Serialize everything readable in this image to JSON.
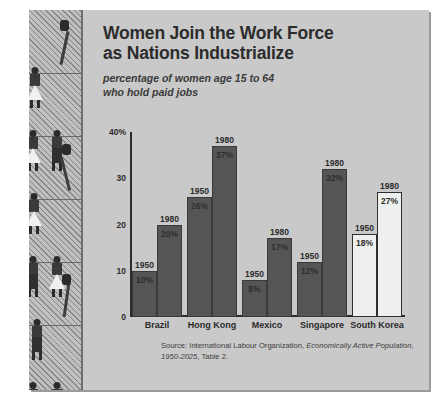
{
  "title": "Women Join the Work Force as Nations Industrialize",
  "title_line1": "Women Join the Work Force",
  "title_line2": "as Nations Industrialize",
  "subtitle_line1": "percentage of women age 15 to 64",
  "subtitle_line2": "who hold paid jobs",
  "source": {
    "prefix": "Source: International Labour Organization, ",
    "italic": "Economically Active Population, 1950-2025",
    "suffix": ", Table 2."
  },
  "colors": {
    "panel_bg": "#c9c9c9",
    "strip_bg": "#bfbfbf",
    "bar_dark": "#555555",
    "bar_light": "#eef0ee",
    "ink": "#2b2b2b"
  },
  "illustration": {
    "name": "women-workers-strip",
    "panels": 6
  },
  "chart_data": {
    "type": "bar",
    "title": "Women Join the Work Force as Nations Industrialize",
    "subtitle": "percentage of women age 15 to 64 who hold paid jobs",
    "xlabel": "",
    "ylabel": "",
    "ylim": [
      0,
      40
    ],
    "grid": false,
    "legend": "none",
    "y_ticks": [
      "0",
      "10",
      "20",
      "30",
      "40%"
    ],
    "categories": [
      "Brazil",
      "Hong Kong",
      "Mexico",
      "Singapore",
      "South Korea"
    ],
    "series": [
      {
        "name": "1950",
        "values": [
          10,
          26,
          8,
          12,
          18
        ]
      },
      {
        "name": "1980",
        "values": [
          20,
          37,
          17,
          32,
          27
        ]
      }
    ],
    "bars": [
      {
        "category": "Brazil",
        "year": "1950",
        "value": 10,
        "label": "10%",
        "style": "dark"
      },
      {
        "category": "Brazil",
        "year": "1980",
        "value": 20,
        "label": "20%",
        "style": "dark"
      },
      {
        "category": "Hong Kong",
        "year": "1950",
        "value": 26,
        "label": "26%",
        "style": "dark"
      },
      {
        "category": "Hong Kong",
        "year": "1980",
        "value": 37,
        "label": "37%",
        "style": "dark"
      },
      {
        "category": "Mexico",
        "year": "1950",
        "value": 8,
        "label": "8%",
        "style": "dark"
      },
      {
        "category": "Mexico",
        "year": "1980",
        "value": 17,
        "label": "17%",
        "style": "dark"
      },
      {
        "category": "Singapore",
        "year": "1950",
        "value": 12,
        "label": "12%",
        "style": "dark"
      },
      {
        "category": "Singapore",
        "year": "1980",
        "value": 32,
        "label": "32%",
        "style": "dark"
      },
      {
        "category": "South Korea",
        "year": "1950",
        "value": 18,
        "label": "18%",
        "style": "light"
      },
      {
        "category": "South Korea",
        "year": "1980",
        "value": 27,
        "label": "27%",
        "style": "light"
      }
    ]
  }
}
